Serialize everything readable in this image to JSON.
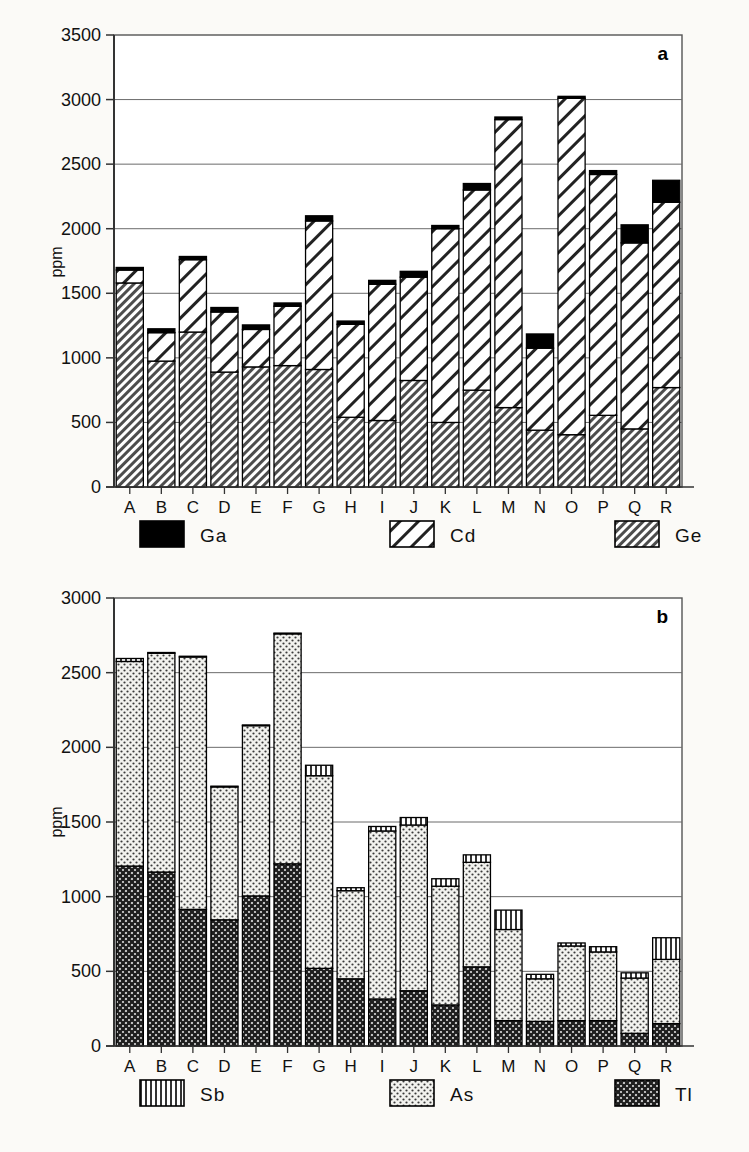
{
  "figure": {
    "background": "#fbfaf7",
    "panel_a_label": "a",
    "panel_b_label": "b"
  },
  "chart_data": [
    {
      "type": "bar",
      "id": "panel-a",
      "stacked": true,
      "title": "",
      "panel_label": "a",
      "xlabel": "",
      "ylabel": "ppm",
      "ylim": [
        0,
        3500
      ],
      "yticks": [
        0,
        500,
        1000,
        1500,
        2000,
        2500,
        3000,
        3500
      ],
      "ytick_labels": [
        "0",
        "500",
        "1000",
        "1500",
        "2000",
        "2500",
        "3000",
        "3500"
      ],
      "grid": true,
      "legend_position": "below",
      "categories": [
        "A",
        "B",
        "C",
        "D",
        "E",
        "F",
        "G",
        "H",
        "I",
        "J",
        "K",
        "L",
        "M",
        "N",
        "O",
        "P",
        "Q",
        "R"
      ],
      "series": [
        {
          "name": "Ge",
          "pattern": "fine-diagonal-hatch",
          "values": [
            1580,
            975,
            1200,
            890,
            930,
            940,
            910,
            540,
            515,
            825,
            500,
            750,
            615,
            440,
            405,
            555,
            450,
            770
          ]
        },
        {
          "name": "Cd",
          "pattern": "wide-diagonal-hatch",
          "values": [
            100,
            220,
            560,
            465,
            290,
            460,
            1150,
            720,
            1055,
            800,
            1500,
            1550,
            2230,
            635,
            2605,
            1865,
            1440,
            1435
          ]
        },
        {
          "name": "Ga",
          "pattern": "solid-black",
          "values": [
            20,
            30,
            25,
            35,
            35,
            25,
            40,
            25,
            30,
            45,
            25,
            50,
            20,
            110,
            15,
            30,
            140,
            170
          ]
        }
      ],
      "series_totals": [
        1700,
        1225,
        1785,
        1390,
        1255,
        1425,
        2100,
        1285,
        1600,
        1670,
        2025,
        2350,
        2865,
        1185,
        3025,
        2450,
        2030,
        2375
      ],
      "legend": [
        {
          "label": "Ga",
          "pattern": "solid-black"
        },
        {
          "label": "Cd",
          "pattern": "wide-diagonal-hatch"
        },
        {
          "label": "Ge",
          "pattern": "fine-diagonal-hatch"
        }
      ]
    },
    {
      "type": "bar",
      "id": "panel-b",
      "stacked": true,
      "title": "",
      "panel_label": "b",
      "xlabel": "",
      "ylabel": "ppm",
      "ylim": [
        0,
        3000
      ],
      "yticks": [
        0,
        500,
        1000,
        1500,
        2000,
        2500,
        3000
      ],
      "ytick_labels": [
        "0",
        "500",
        "1000",
        "1500",
        "2000",
        "2500",
        "3000"
      ],
      "grid": true,
      "legend_position": "below",
      "categories": [
        "A",
        "B",
        "C",
        "D",
        "E",
        "F",
        "G",
        "H",
        "I",
        "J",
        "K",
        "L",
        "M",
        "N",
        "O",
        "P",
        "Q",
        "R"
      ],
      "series": [
        {
          "name": "Tl",
          "pattern": "crosshatch",
          "values": [
            1205,
            1165,
            915,
            845,
            1005,
            1220,
            520,
            450,
            315,
            370,
            275,
            530,
            170,
            165,
            170,
            170,
            85,
            150
          ]
        },
        {
          "name": "As",
          "pattern": "fine-dots",
          "values": [
            1370,
            1465,
            1690,
            890,
            1140,
            1540,
            1290,
            590,
            1125,
            1110,
            795,
            700,
            610,
            285,
            500,
            460,
            370,
            430
          ]
        },
        {
          "name": "Sb",
          "pattern": "vertical-lines",
          "values": [
            20,
            5,
            5,
            5,
            5,
            5,
            70,
            20,
            30,
            50,
            50,
            50,
            130,
            30,
            20,
            35,
            35,
            145
          ]
        }
      ],
      "series_totals": [
        2595,
        2635,
        2610,
        1740,
        2150,
        2765,
        1880,
        1060,
        1470,
        1530,
        1120,
        1280,
        910,
        480,
        690,
        665,
        490,
        725
      ],
      "legend": [
        {
          "label": "Sb",
          "pattern": "vertical-lines"
        },
        {
          "label": "As",
          "pattern": "fine-dots"
        },
        {
          "label": "Tl",
          "pattern": "crosshatch"
        }
      ]
    }
  ]
}
